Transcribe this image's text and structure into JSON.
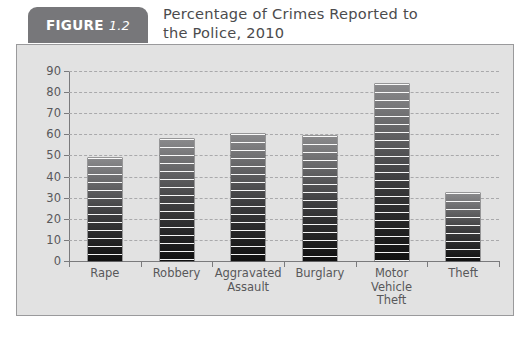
{
  "figure": {
    "badge_word": "FIGURE",
    "badge_number": "1.2",
    "title_line1": "Percentage of Crimes Reported to",
    "title_line2": "the Police, 2010",
    "badge_color": "#77777a",
    "panel_color": "#e2e2e2",
    "bar_color": "#1a1a1a",
    "text_color": "#58585a"
  },
  "chart_data": {
    "type": "bar",
    "title": "Percentage of Crimes Reported to the Police, 2010",
    "categories": [
      "Rape",
      "Robbery",
      "Aggravated Assault",
      "Burglary",
      "Motor Vehicle Theft",
      "Theft"
    ],
    "category_lines": [
      [
        "Rape"
      ],
      [
        "Robbery"
      ],
      [
        "Aggravated",
        "Assault"
      ],
      [
        "Burglary"
      ],
      [
        "Motor",
        "Vehicle",
        "Theft"
      ],
      [
        "Theft"
      ]
    ],
    "values": [
      49,
      58,
      60,
      59,
      84,
      32
    ],
    "xlabel": "",
    "ylabel": "",
    "ylim": [
      0,
      90
    ],
    "yticks": [
      0,
      10,
      20,
      30,
      40,
      50,
      60,
      70,
      80,
      90
    ],
    "ytick_labels": [
      "0",
      "10",
      "20",
      "30",
      "40",
      "50",
      "60",
      "70",
      "80",
      "90"
    ],
    "grid": true,
    "legend": false
  }
}
